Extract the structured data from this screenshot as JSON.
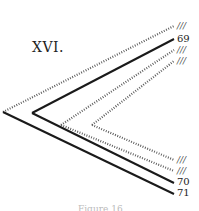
{
  "figure": {
    "title": "XVI.",
    "caption": "Figure 16",
    "labels": [
      {
        "text": "///",
        "y": 21,
        "style": "marks"
      },
      {
        "text": "69",
        "y": 34,
        "style": "num"
      },
      {
        "text": "///",
        "y": 45,
        "style": "marks"
      },
      {
        "text": "///",
        "y": 56,
        "style": "marks"
      },
      {
        "text": "///",
        "y": 155,
        "style": "marks"
      },
      {
        "text": "///",
        "y": 166,
        "style": "marks"
      },
      {
        "text": "70",
        "y": 177,
        "style": "num"
      },
      {
        "text": "71",
        "y": 188,
        "style": "num"
      }
    ],
    "lines": [
      {
        "name": "outer-top-dotted",
        "x1": 3,
        "y1": 112,
        "x2": 174,
        "y2": 26,
        "dotted": true
      },
      {
        "name": "line-69",
        "x1": 32,
        "y1": 113,
        "x2": 174,
        "y2": 39,
        "dotted": false
      },
      {
        "name": "inner1-top-dotted",
        "x1": 61,
        "y1": 125,
        "x2": 174,
        "y2": 50,
        "dotted": true
      },
      {
        "name": "inner2-top-dotted",
        "x1": 92,
        "y1": 125,
        "x2": 174,
        "y2": 61,
        "dotted": true
      },
      {
        "name": "inner2-bottom-dotted",
        "x1": 92,
        "y1": 125,
        "x2": 174,
        "y2": 160,
        "dotted": true
      },
      {
        "name": "inner1-bottom-dotted",
        "x1": 61,
        "y1": 125,
        "x2": 174,
        "y2": 171,
        "dotted": true
      },
      {
        "name": "line-70",
        "x1": 32,
        "y1": 113,
        "x2": 174,
        "y2": 183,
        "dotted": false
      },
      {
        "name": "line-71",
        "x1": 3,
        "y1": 112,
        "x2": 174,
        "y2": 194,
        "dotted": false
      }
    ]
  }
}
